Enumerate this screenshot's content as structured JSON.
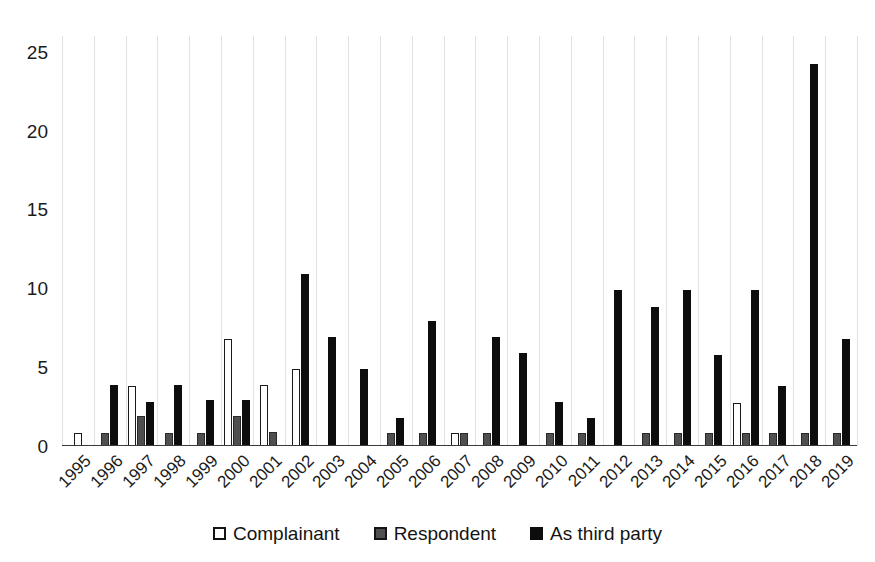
{
  "chart_data": {
    "type": "bar",
    "title": "",
    "subtitle": "",
    "xlabel": "",
    "ylabel": "",
    "ylim": [
      0,
      26
    ],
    "yticks": [
      0,
      5,
      10,
      15,
      20,
      25
    ],
    "ytick_labels": [
      "0",
      "5",
      "10",
      "15",
      "20",
      "25"
    ],
    "grid": "vertical-only",
    "legend_position": "bottom-center",
    "categories": [
      "1995",
      "1996",
      "1997",
      "1998",
      "1999",
      "2000",
      "2001",
      "2002",
      "2003",
      "2004",
      "2005",
      "2006",
      "2007",
      "2008",
      "2009",
      "2010",
      "2011",
      "2012",
      "2013",
      "2014",
      "2015",
      "2016",
      "2017",
      "2018",
      "2019"
    ],
    "series": [
      {
        "name": "Complainant",
        "color": "#ffffff",
        "values": [
          0.8,
          0,
          3.8,
          0,
          0,
          6.8,
          3.9,
          4.9,
          0,
          0,
          0,
          0,
          0.8,
          0,
          0,
          0,
          0,
          0,
          0,
          0,
          0,
          2.7,
          0,
          0,
          0
        ]
      },
      {
        "name": "Respondent",
        "color": "#4f4f4f",
        "values": [
          0,
          0.8,
          1.9,
          0.8,
          0.8,
          1.9,
          0.9,
          0,
          0,
          0,
          0.8,
          0.8,
          0.8,
          0.8,
          0,
          0.8,
          0.8,
          0,
          0.8,
          0.8,
          0.8,
          0.8,
          0.8,
          0.8,
          0.8
        ]
      },
      {
        "name": "As third party",
        "color": "#0d0d0d",
        "values": [
          0,
          3.9,
          2.8,
          3.9,
          2.9,
          2.9,
          0,
          10.9,
          6.9,
          4.9,
          1.8,
          7.9,
          0,
          6.9,
          5.9,
          2.8,
          1.8,
          9.9,
          8.8,
          9.9,
          5.8,
          9.9,
          3.8,
          24.2,
          6.8
        ]
      }
    ]
  },
  "legend": {
    "items": [
      {
        "label": "Complainant",
        "swatch": "open-square-icon"
      },
      {
        "label": "Respondent",
        "swatch": "gray-square-icon"
      },
      {
        "label": "As third party",
        "swatch": "black-square-icon"
      }
    ]
  },
  "colors": {
    "complainant": "#ffffff",
    "respondent": "#4f4f4f",
    "third_party": "#0d0d0d",
    "grid": "#e2e2e2",
    "axis": "#3a3a3a",
    "text": "#1b1b1b",
    "background": "#ffffff"
  }
}
